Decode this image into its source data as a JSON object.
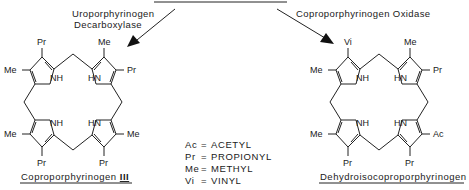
{
  "diagram": {
    "type": "biochemical-pathway",
    "enzymes": {
      "left_line1": "Uroporphyrinogen",
      "left_line2": "Decarboxylase",
      "right": "Coproporphyrinogen Oxidase"
    },
    "compounds": {
      "left": {
        "name": "Coproporphyrinogen",
        "suffix": "III",
        "substituents": {
          "top_left": "Pr",
          "top_right": "Me",
          "left_upper": "Me",
          "right_upper": "Pr",
          "left_lower": "Me",
          "right_lower": "Me",
          "bottom_left": "Pr",
          "bottom_right": "Pr"
        },
        "nh": [
          "NH",
          "HN",
          "NH",
          "HN"
        ]
      },
      "right": {
        "name": "Dehydroisocoproporphyrinogen",
        "substituents": {
          "top_left": "Vi",
          "top_right": "Me",
          "left_upper": "Me",
          "right_upper": "Pr",
          "left_lower": "Me",
          "right_lower": "Ac",
          "bottom_left": "Pr",
          "bottom_right": "Pr"
        },
        "nh": [
          "NH",
          "HN",
          "NH",
          "HN"
        ]
      }
    },
    "legend": [
      {
        "abbr": "Ac",
        "eq": "=",
        "full": "ACETYL"
      },
      {
        "abbr": "Pr",
        "eq": "=",
        "full": "PROPIONYL"
      },
      {
        "abbr": "Me",
        "eq": "=",
        "full": "METHYL"
      },
      {
        "abbr": "Vi",
        "eq": "=",
        "full": "VINYL"
      }
    ]
  }
}
